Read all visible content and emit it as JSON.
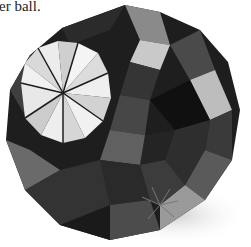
{
  "caption": {
    "text": "er ball."
  },
  "photo": {
    "subject": "origami kusudama ball",
    "colors": {
      "dark": "#1c1c1c",
      "mid": "#555555",
      "light": "#d8d8d8",
      "white": "#f2f2f2",
      "shadow": "#e6e6e6"
    }
  }
}
